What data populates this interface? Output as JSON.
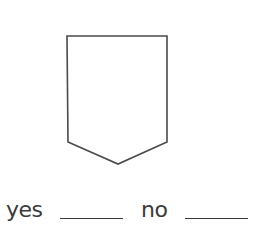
{
  "figure": {
    "shape": "pentagon",
    "points": [
      [
        67,
        36
      ],
      [
        167,
        36
      ],
      [
        167,
        142
      ],
      [
        118,
        164
      ],
      [
        68,
        142
      ]
    ],
    "stroke_color": "#4a4a4a",
    "fill_color": "#ffffff"
  },
  "answers": {
    "yes_label": "yes",
    "no_label": "no"
  },
  "colors": {
    "text": "#3a3a3a",
    "line": "#4a4a4a",
    "background": "#ffffff"
  }
}
